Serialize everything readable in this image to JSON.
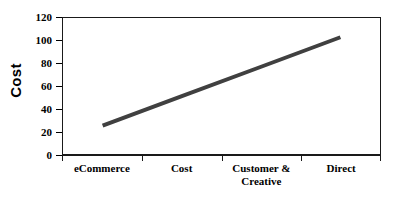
{
  "chart_data": {
    "type": "line",
    "title": "",
    "subtitle": "",
    "xlabel": "",
    "ylabel": "Cost",
    "categories": [
      "eCommerce",
      "Cost",
      "Customer & Creative",
      "Direct"
    ],
    "category_lines": [
      [
        "eCommerce"
      ],
      [
        "Cost"
      ],
      [
        "Customer &",
        "Creative"
      ],
      [
        "Direct"
      ]
    ],
    "series": [
      {
        "name": "Cost",
        "values": [
          25,
          51,
          77,
          103
        ],
        "color": "#404040",
        "line_width": 4
      }
    ],
    "x": [
      "eCommerce",
      "Cost",
      "Customer & Creative",
      "Direct"
    ],
    "ylim": [
      0,
      120
    ],
    "y_ticks": [
      0,
      20,
      40,
      60,
      80,
      100,
      120
    ],
    "y_tick_labels": [
      "0",
      "20",
      "40",
      "60",
      "80",
      "100",
      "120"
    ],
    "x_tick_count": 5,
    "grid": false,
    "legend": false,
    "legend_position": "none",
    "annotations": [],
    "background_color": "#ffffff",
    "axis_color": "#1a1a1a"
  }
}
